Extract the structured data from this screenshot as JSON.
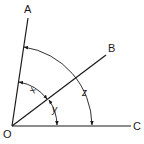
{
  "diagram": {
    "type": "angle-diagram",
    "vertex": {
      "label": "O",
      "x": 12,
      "y": 126
    },
    "rays": [
      {
        "label": "A",
        "end_x": 28,
        "end_y": 18
      },
      {
        "label": "B",
        "end_x": 106,
        "end_y": 55
      },
      {
        "label": "C",
        "end_x": 131,
        "end_y": 126
      }
    ],
    "angles": [
      {
        "label": "x",
        "from": "OA",
        "to": "OB"
      },
      {
        "label": "y",
        "from": "OB",
        "to": "OC"
      },
      {
        "label": "z",
        "from": "OA",
        "to": "OC"
      }
    ],
    "colors": {
      "line": "#1a1a1a",
      "background": "#ffffff"
    }
  },
  "labels": {
    "O": "O",
    "A": "A",
    "B": "B",
    "C": "C",
    "x": "x",
    "y": "y",
    "z": "z"
  }
}
